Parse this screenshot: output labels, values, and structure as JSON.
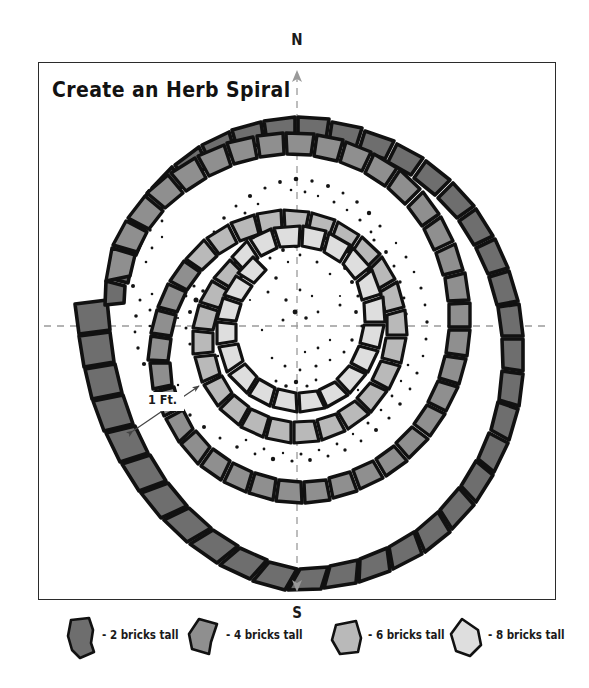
{
  "title": "Create an Herb Spiral",
  "compass": {
    "north_label": "N",
    "south_label": "S"
  },
  "dimension": {
    "label": "1 Ft."
  },
  "colors": {
    "outline": "#111111",
    "frame": "#2b2b2b",
    "background": "#ffffff",
    "axis": "#9a9a9a",
    "soil": "#1a1a1a",
    "brick_2": "#6e6e6e",
    "brick_4": "#8f8f8f",
    "brick_6": "#b9b9b9",
    "brick_8": "#dedede"
  },
  "legend": {
    "items": [
      {
        "label": "- 2 bricks tall",
        "color": "#6e6e6e",
        "height_bricks": 2
      },
      {
        "label": "- 4 bricks tall",
        "color": "#8f8f8f",
        "height_bricks": 4
      },
      {
        "label": "- 6 bricks tall",
        "color": "#b9b9b9",
        "height_bricks": 6
      },
      {
        "label": "- 8 bricks tall",
        "color": "#dedede",
        "height_bricks": 8
      }
    ]
  },
  "diagram": {
    "type": "herb-spiral-garden-plan",
    "center": {
      "x": 297,
      "y": 326
    },
    "rings": [
      {
        "name": "outer-ring",
        "brick_tone": "#6e6e6e",
        "description": "outermost spiral course, 2 bricks tall"
      },
      {
        "name": "second-ring",
        "brick_tone": "#8f8f8f",
        "description": "second spiral course, 4 bricks tall"
      },
      {
        "name": "third-ring",
        "brick_tone": "#b9b9b9",
        "description": "third spiral course, 6 bricks tall"
      },
      {
        "name": "inner-ring",
        "brick_tone": "#dedede",
        "description": "innermost spiral course, 8 bricks tall"
      }
    ]
  }
}
